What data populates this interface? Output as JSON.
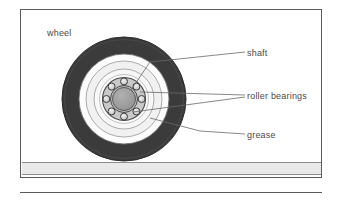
{
  "figure": {
    "frame": {
      "border_color": "#5a5a5a"
    },
    "ground": {
      "name": "ground-surface",
      "color": "#e9e9e9"
    }
  },
  "labels": [
    {
      "id": "wheel",
      "text": "wheel",
      "has_leader": false
    },
    {
      "id": "shaft",
      "text": "shaft",
      "has_leader": true
    },
    {
      "id": "roller-bearings",
      "text": "roller bearings",
      "has_leader": true
    },
    {
      "id": "grease",
      "text": "grease",
      "has_leader": true
    }
  ],
  "diagram": {
    "type": "cross-section",
    "center": {
      "x": 124,
      "y": 99
    },
    "components": [
      {
        "name": "tire",
        "shape": "annulus",
        "outer_r": 62,
        "inner_r": 45,
        "color": "#3b3b3b"
      },
      {
        "name": "grease-packing",
        "shape": "annulus",
        "outer_r": 45,
        "inner_r": 38,
        "color": "#fbfbfb"
      },
      {
        "name": "rim-outer",
        "shape": "annulus",
        "outer_r": 38,
        "inner_r": 30,
        "color": "#f2f2f2"
      },
      {
        "name": "rim-inner",
        "shape": "annulus",
        "outer_r": 30,
        "inner_r": 22,
        "color": "#f7f7f7"
      },
      {
        "name": "bearing-race",
        "shape": "annulus",
        "outer_r": 22,
        "inner_r": 14,
        "color": "#c9c9c9"
      },
      {
        "name": "shaft",
        "shape": "circle",
        "outer_r": 12,
        "color": "#9a9a9a"
      }
    ],
    "roller_bearings": {
      "count": 8,
      "ball_r": 3.4,
      "orbit_r": 18,
      "color": "#d6d6d6"
    }
  },
  "colors": {
    "tire": "#3b3b3b",
    "shaft": "#9a9a9a",
    "bearing": "#d6d6d6",
    "outline": "#4a4a4a",
    "ground": "#e9e9e9",
    "frame": "#5a5a5a",
    "text": "#4a4a4a"
  }
}
